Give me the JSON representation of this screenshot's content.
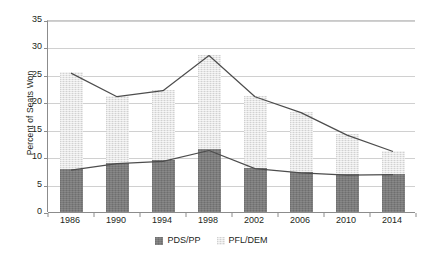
{
  "chart_data": {
    "type": "bar",
    "title": "",
    "subtitle": "",
    "xlabel": "",
    "ylabel": "Percent of Seats Won",
    "categories": [
      "1986",
      "1990",
      "1994",
      "1998",
      "2002",
      "2006",
      "2010",
      "2014"
    ],
    "series": [
      {
        "name": "PDS/PP",
        "color": "#7b7b7b",
        "values": [
          7.8,
          9.0,
          9.4,
          11.4,
          8.1,
          7.3,
          6.9,
          7.0
        ]
      },
      {
        "name": "PFL/DEM",
        "color": "#e6e6e6",
        "values": [
          17.7,
          12.2,
          12.9,
          17.3,
          13.1,
          11.0,
          7.3,
          4.2
        ]
      }
    ],
    "totals": [
      25.5,
      21.2,
      22.3,
      28.7,
      21.2,
      18.3,
      14.2,
      11.2
    ],
    "stacked": true,
    "overlay_lines": [
      {
        "name": "total-line",
        "values": [
          25.5,
          21.2,
          22.3,
          28.7,
          21.2,
          18.3,
          14.2,
          11.2
        ],
        "color": "#4d4d4d"
      },
      {
        "name": "pds-pp-line",
        "values": [
          7.8,
          9.0,
          9.4,
          11.4,
          8.1,
          7.3,
          6.9,
          7.0
        ],
        "color": "#4d4d4d"
      }
    ],
    "ylim": [
      0,
      35
    ],
    "yticks": [
      0,
      5,
      10,
      15,
      20,
      25,
      30,
      35
    ],
    "ytick_labels": [
      "0",
      "5",
      "10",
      "15",
      "20",
      "25",
      "30",
      "35"
    ],
    "grid": true,
    "grid_axis": "y",
    "legend_position": "bottom"
  },
  "legend": {
    "entries": [
      {
        "label": "PDS/PP",
        "color": "#7b7b7b"
      },
      {
        "label": "PFL/DEM",
        "color": "#e6e6e6"
      }
    ]
  },
  "colors": {
    "gridline": "#d0d0d0",
    "axis": "#8c8c8c",
    "line": "#4d4d4d",
    "text": "#231f20",
    "background": "#ffffff"
  }
}
